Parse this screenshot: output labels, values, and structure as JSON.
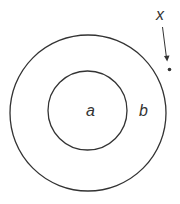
{
  "diagram": {
    "labels": {
      "inner": "a",
      "ring": "b",
      "point": "x"
    },
    "colors": {
      "stroke": "#333333",
      "background": "#ffffff"
    }
  }
}
